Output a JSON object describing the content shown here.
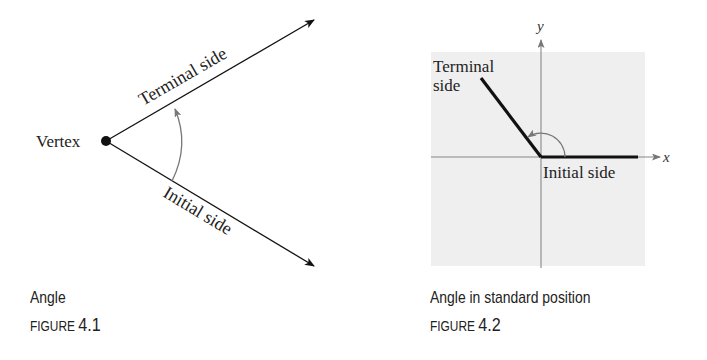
{
  "figure1": {
    "vertex_label": "Vertex",
    "terminal_label": "Terminal side",
    "initial_label": "Initial side",
    "caption": "Angle",
    "figure_word": "FIGURE",
    "figure_number": "4.1"
  },
  "figure2": {
    "y_axis_label": "y",
    "x_axis_label": "x",
    "terminal_label_line1": "Terminal",
    "terminal_label_line2": "side",
    "initial_label": "Initial side",
    "caption": "Angle in standard position",
    "figure_word": "FIGURE",
    "figure_number": "4.2",
    "panel_color": "#efefef"
  }
}
